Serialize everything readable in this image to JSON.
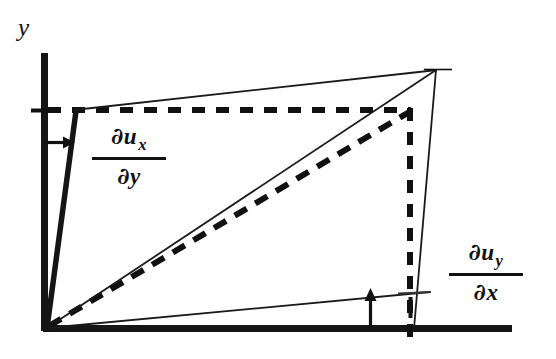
{
  "figure": {
    "background_color": "#ffffff",
    "ink_color": "#111111"
  },
  "axes": {
    "y_axis": {
      "label": "y",
      "x": 43,
      "y_top": 53,
      "y_bottom": 331,
      "thickness": 7
    },
    "x_axis": {
      "label": "",
      "y": 328,
      "x_left": 43,
      "x_right": 512,
      "thickness": 7
    }
  },
  "labels": {
    "y_axis_label": "y",
    "du_x_dy": {
      "numerator_partial": "∂",
      "numerator_var": "u",
      "numerator_sub": "x",
      "denominator_partial": "∂",
      "denominator_var": "y"
    },
    "du_y_dx": {
      "numerator_partial": "∂",
      "numerator_var": "u",
      "numerator_sub": "y",
      "denominator_partial": "∂",
      "denominator_var": "x"
    }
  },
  "geometry": {
    "origin": {
      "x": 47,
      "y": 327
    },
    "apex": {
      "x": 436,
      "y": 70
    },
    "deformed_top_left": {
      "x": 76,
      "y": 111
    },
    "deformed_bottom_right": {
      "x": 415,
      "y": 292
    },
    "reference_square": {
      "top_left": {
        "x": 47,
        "y": 110
      },
      "top_right": {
        "x": 411,
        "y": 110
      },
      "bottom_right": {
        "x": 411,
        "y": 328
      },
      "style": "dashed"
    },
    "diagonal_reference": {
      "from": {
        "x": 47,
        "y": 327
      },
      "to": {
        "x": 411,
        "y": 110
      },
      "style": "dashed"
    },
    "diagonal_deformed": {
      "from": {
        "x": 47,
        "y": 327
      },
      "to": {
        "x": 436,
        "y": 70
      },
      "style": "solid"
    },
    "left_edge_deformed": {
      "from": {
        "x": 47,
        "y": 327
      },
      "to": {
        "x": 76,
        "y": 111
      },
      "style": "solid-thick"
    },
    "top_edge_deformed": {
      "from": {
        "x": 76,
        "y": 111
      },
      "to": {
        "x": 436,
        "y": 70
      },
      "style": "solid-thin"
    },
    "right_edge_deformed": {
      "from": {
        "x": 436,
        "y": 70
      },
      "to": {
        "x": 415,
        "y": 328
      },
      "style": "solid-thin"
    },
    "bottom_edge_deformed": {
      "from": {
        "x": 47,
        "y": 327
      },
      "to": {
        "x": 428,
        "y": 292
      },
      "style": "solid-thin"
    }
  },
  "annotations": {
    "horizontal_displacement_arrow": {
      "name": "du-x-arrow",
      "direction": "right",
      "from": {
        "x": 45,
        "y": 142
      },
      "to": {
        "x": 74,
        "y": 142
      }
    },
    "vertical_displacement_arrow": {
      "name": "du-y-arrow",
      "direction": "up",
      "from": {
        "x": 370,
        "y": 327
      },
      "to": {
        "x": 370,
        "y": 291
      }
    },
    "tick_y_reference": {
      "x_from": 33,
      "x_to": 50,
      "y": 110
    },
    "tick_x_reference": {
      "y_from": 300,
      "y_to": 318,
      "x": 411
    }
  }
}
